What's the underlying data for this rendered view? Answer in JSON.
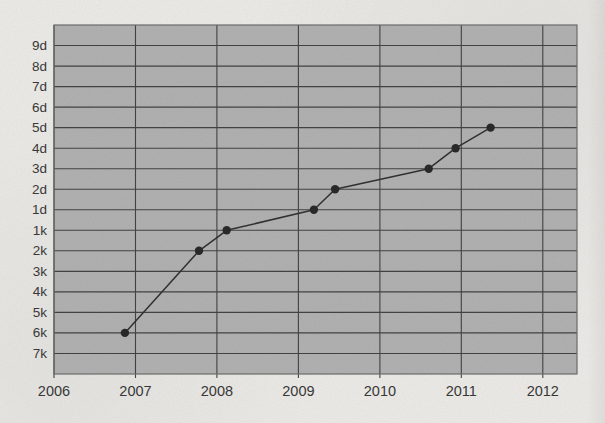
{
  "figure": {
    "background": "#f2f1ed",
    "plot_background": "#b6b6b6",
    "gridline_color": "#454545",
    "border_color": "#707070",
    "line_color": "#333333",
    "point_color": "#2b2b2b",
    "label_color": "#3b3b3b"
  },
  "chart_data": {
    "type": "line",
    "title": "",
    "xlabel": "",
    "ylabel": "",
    "grid": true,
    "legend": false,
    "x_axis": {
      "min": 2006,
      "max": 2012.42,
      "ticks": [
        2006,
        2007,
        2008,
        2009,
        2010,
        2011,
        2012
      ]
    },
    "y_axis": {
      "categories_bottom_to_top": [
        "7k",
        "6k",
        "5k",
        "4k",
        "3k",
        "2k",
        "1k",
        "1d",
        "2d",
        "3d",
        "4d",
        "5d",
        "6d",
        "7d",
        "8d",
        "9d"
      ]
    },
    "points": [
      {
        "x": 2006.87,
        "rank": "6k"
      },
      {
        "x": 2007.78,
        "rank": "2k"
      },
      {
        "x": 2008.12,
        "rank": "1k"
      },
      {
        "x": 2009.19,
        "rank": "1d"
      },
      {
        "x": 2009.45,
        "rank": "2d"
      },
      {
        "x": 2010.6,
        "rank": "3d"
      },
      {
        "x": 2010.93,
        "rank": "4d"
      },
      {
        "x": 2011.36,
        "rank": "5d"
      }
    ]
  }
}
